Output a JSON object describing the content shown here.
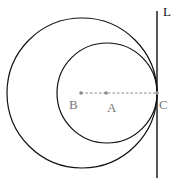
{
  "diagram": {
    "labels": {
      "L": "L",
      "A": "A",
      "B": "B",
      "C": "C"
    },
    "colors": {
      "stroke": "#111111",
      "point": "#888888",
      "label": "#777777"
    },
    "big_circle": {
      "cx": 82,
      "cy": 93,
      "r": 75
    },
    "small_circle": {
      "cx": 107,
      "cy": 93,
      "r": 50
    },
    "line_L": {
      "x": 157,
      "y1": 12,
      "y2": 178
    },
    "points": {
      "B": {
        "x": 81,
        "y": 93
      },
      "A": {
        "x": 106,
        "y": 93
      },
      "C": {
        "x": 157,
        "y": 93
      }
    }
  }
}
